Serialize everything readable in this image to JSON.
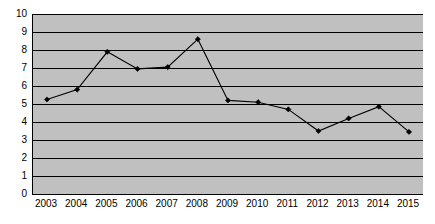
{
  "chart_data": {
    "type": "line",
    "title": "",
    "subtitle": "",
    "xlabel": "",
    "ylabel": "",
    "categories": [
      "2003",
      "2004",
      "2005",
      "2006",
      "2007",
      "2008",
      "2009",
      "2010",
      "2011",
      "2012",
      "2013",
      "2014",
      "2015"
    ],
    "values": [
      5.25,
      5.8,
      7.9,
      6.95,
      7.05,
      8.6,
      5.2,
      5.1,
      4.7,
      3.5,
      4.2,
      4.85,
      3.45
    ],
    "series": [
      {
        "name": "",
        "values": [
          5.25,
          5.8,
          7.9,
          6.95,
          7.05,
          8.6,
          5.2,
          5.1,
          4.7,
          3.5,
          4.2,
          4.85,
          3.45
        ]
      }
    ],
    "ylim": [
      0,
      10
    ],
    "ytick_labels": [
      "0",
      "1",
      "2",
      "3",
      "4",
      "5",
      "6",
      "7",
      "8",
      "9",
      "10"
    ],
    "ytick_values": [
      0,
      1,
      2,
      3,
      4,
      5,
      6,
      7,
      8,
      9,
      10
    ],
    "xtick_labels": [
      "2003",
      "2004",
      "2005",
      "2006",
      "2007",
      "2008",
      "2009",
      "2010",
      "2011",
      "2012",
      "2013",
      "2014",
      "2015"
    ],
    "grid": {
      "horizontal": true,
      "vertical": false
    },
    "legend": {
      "visible": false,
      "position": "none",
      "entries": []
    },
    "annotations": [],
    "marker": "diamond",
    "colors": {
      "plot_background": "#c0c0c0",
      "page_background": "#ffffff",
      "gridline": "#000000",
      "axis": "#000000",
      "line": "#000000",
      "marker": "#000000",
      "tick_label": "#000000"
    }
  }
}
